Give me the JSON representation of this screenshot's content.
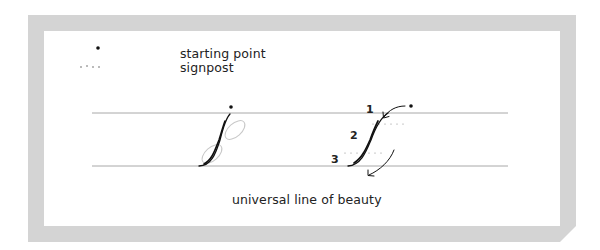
{
  "legend": {
    "items": [
      {
        "symbol": "dot",
        "icon": "starting-point-dot-icon",
        "label": "starting point"
      },
      {
        "symbol": "dotted-line",
        "icon": "signpost-dotted-icon",
        "label": "signpost"
      }
    ]
  },
  "figures": {
    "left": {
      "description": "upstroke with guide ovals"
    },
    "right": {
      "description": "upstroke with numbered signposts and direction arrows",
      "step_labels": [
        "1",
        "2",
        "3"
      ]
    }
  },
  "caption": "universal line of beauty",
  "colors": {
    "frame": "#d4d4d4",
    "panel": "#ffffff",
    "guide_line": "#a8a8a8",
    "stroke": "#111111",
    "oval": "#c8c8c8",
    "text": "#222222"
  }
}
